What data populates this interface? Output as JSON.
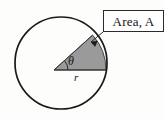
{
  "figure": {
    "type": "geometry-diagram",
    "background_color": "#fdfdfc",
    "callout": {
      "label": "Area, A",
      "box_border_color": "#2b2b2b",
      "box_fill_color": "#ffffff",
      "leader_line_color": "#2b2b2b",
      "has_arrowhead": true,
      "points_to": "sector-arc"
    },
    "circle": {
      "name": "circle-outline",
      "center_x": 61,
      "center_y": 63,
      "radius": 46,
      "stroke_color": "#1a1a1a",
      "stroke_width": 1.6,
      "fill": "none"
    },
    "sector": {
      "name": "shaded-sector",
      "fill_color": "#9a9a9a",
      "stroke_color": "#3a3a3a",
      "start_angle_deg": 0,
      "end_angle_deg": 42,
      "vertex_x": 54,
      "vertex_y": 70
    },
    "labels": {
      "angle": "θ",
      "angle_name": "theta",
      "radius": "r",
      "radius_name": "r"
    },
    "angle_arc": {
      "name": "angle-arc-marker",
      "stroke_color": "#2a2a2a",
      "radius": 14
    }
  }
}
